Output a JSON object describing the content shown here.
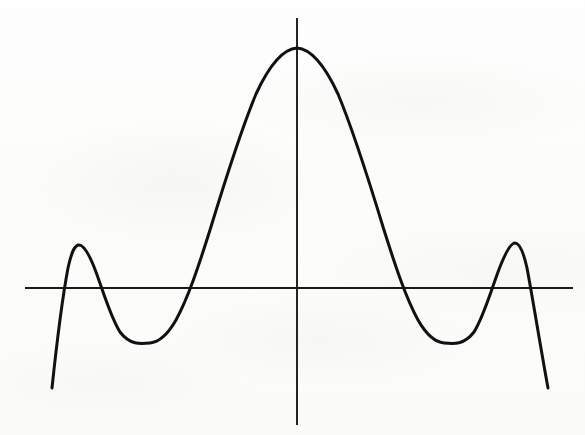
{
  "figure": {
    "title": "",
    "caption": "",
    "media": "scanned-page",
    "background_color": "#fdfdfc",
    "ink_color": "#111111",
    "axis_color": "#1a1a1a"
  },
  "axes": {
    "x_axis": {
      "name": "horizontal-axis",
      "label": "",
      "y_pixel": 288,
      "x_start_pixel": 25,
      "x_end_pixel": 573,
      "ticks": [],
      "tick_labels": []
    },
    "y_axis": {
      "name": "vertical-axis",
      "label": "",
      "x_pixel": 297,
      "y_start_pixel": 18,
      "y_end_pixel": 425,
      "ticks": [],
      "tick_labels": []
    },
    "origin_pixel": [
      297,
      288
    ]
  },
  "ghost_marks": [
    {
      "text": "",
      "left": 60,
      "top": 172
    },
    {
      "text": "",
      "left": 215,
      "top": 198
    },
    {
      "text": "",
      "left": 330,
      "top": 120
    },
    {
      "text": "",
      "left": 95,
      "top": 330
    },
    {
      "text": "",
      "left": 400,
      "top": 360
    }
  ],
  "chart_data": {
    "type": "line",
    "title": "",
    "xlabel": "",
    "ylabel": "",
    "subtitle": "",
    "legend": [],
    "legend_position": "none",
    "grid": false,
    "series": [
      {
        "name": "sinc-like waveform",
        "description": "Damped oscillatory curve: tall central lobe with symmetric decaying side lobes, resembling sin(x)/x",
        "x": [
          -6.0,
          -5.5,
          -5.0,
          -4.5,
          -4.0,
          -3.5,
          -3.0,
          -2.5,
          -2.0,
          -1.5,
          -1.0,
          -0.5,
          0.0,
          0.5,
          1.0,
          1.5,
          2.0,
          2.5,
          3.0,
          3.5,
          4.0,
          4.5,
          5.0,
          5.5,
          6.0
        ],
        "y": [
          -1.12,
          -0.46,
          0.18,
          0.38,
          0.23,
          -0.05,
          -0.3,
          -0.41,
          -0.22,
          0.35,
          1.15,
          1.84,
          2.06,
          1.84,
          1.15,
          0.35,
          -0.22,
          -0.41,
          -0.3,
          -0.05,
          0.23,
          0.38,
          0.18,
          -0.46,
          -1.12
        ]
      }
    ],
    "xlim": [
      -6.3,
      6.3
    ],
    "ylim": [
      -1.35,
      2.35
    ],
    "features": {
      "global_maximum": {
        "label": "central peak",
        "x": 0.0,
        "y": 2.06,
        "pixel": [
          297,
          48
        ]
      },
      "local_maxima": [
        {
          "label": "left side lobe",
          "x": -4.5,
          "y": 0.38,
          "pixel": [
            77,
            245
          ]
        },
        {
          "label": "right side lobe",
          "x": 4.5,
          "y": 0.38,
          "pixel": [
            517,
            243
          ]
        }
      ],
      "local_minima": [
        {
          "label": "left trough",
          "x": -2.5,
          "y": -0.41,
          "pixel": [
            148,
            343
          ]
        },
        {
          "label": "right trough",
          "x": 2.5,
          "y": -0.41,
          "pixel": [
            442,
            342
          ]
        }
      ],
      "zero_crossings": [
        {
          "x": -5.2,
          "pixel_x": 112
        },
        {
          "x": -3.1,
          "pixel_x": 203
        },
        {
          "x": 3.1,
          "pixel_x": 392
        },
        {
          "x": 5.2,
          "pixel_x": 482
        }
      ],
      "endpoints": [
        {
          "label": "left tail end",
          "x": -6.05,
          "y": -1.12,
          "pixel": [
            52,
            388
          ]
        },
        {
          "label": "right tail end",
          "x": 6.05,
          "y": -1.12,
          "pixel": [
            548,
            388
          ]
        }
      ]
    },
    "path_d": "M 52 388 C 56 350 62 300 68 268 C 72 250 75 245 79 245 C 84 245 90 256 96 272 C 104 294 111 318 120 332 C 130 345 140 344 150 343 C 160 342 168 334 176 320 C 188 298 198 268 210 230 C 224 184 240 132 256 94 C 268 68 282 49 297 48 C 312 49 326 68 338 94 C 354 132 370 184 384 230 C 396 268 406 298 418 320 C 426 334 434 342 444 343 C 454 344 464 345 474 332 C 483 318 490 294 498 272 C 504 256 510 243 515 243 C 519 243 523 250 527 268 C 533 300 541 350 548 388"
  }
}
